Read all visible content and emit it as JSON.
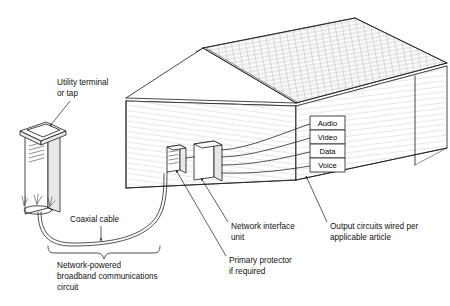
{
  "figure": {
    "title": "Network-powered broadband communications circuit",
    "background_color": "#ffffff",
    "line_color": "#1a1a1a",
    "text_color": "#111111"
  },
  "labels": {
    "utility_terminal_line1": "Utility terminal",
    "utility_terminal_line2": "or tap",
    "coaxial_cable": "Coaxial cable",
    "circuit_line1": "Network-powered",
    "circuit_line2": "broadband communications",
    "circuit_line3": "circuit",
    "niu_line1": "Network interface",
    "niu_line2": "unit",
    "protector_line1": "Primary protector",
    "protector_line2": "if required",
    "output_line1": "Output circuits wired per",
    "output_line2": "applicable article"
  },
  "output_ports": [
    {
      "name": "Audio"
    },
    {
      "name": "Video"
    },
    {
      "name": "Data"
    },
    {
      "name": "Voice"
    }
  ],
  "components": {
    "pedestal": "utility-terminal-pedestal",
    "house": "building",
    "primary_protector": "primary-protector-box",
    "network_interface_unit": "network-interface-unit-box"
  }
}
